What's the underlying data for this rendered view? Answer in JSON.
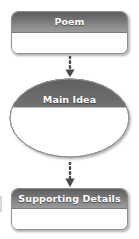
{
  "diagram": {
    "type": "vertical-flowchart",
    "background_color": "#ffffff",
    "header_gradient_from": "#5f5f5f",
    "header_gradient_to": "#9b9b9b",
    "header_text_color": "#ffffff",
    "border_color": "#8e8e8e",
    "connector_color": "#4a4a4a",
    "nodes": [
      {
        "id": "poem",
        "label": "Poem",
        "shape": "rounded-rectangle"
      },
      {
        "id": "main-idea",
        "label": "Main Idea",
        "shape": "ellipse"
      },
      {
        "id": "supporting-details",
        "label": "Supporting Details",
        "shape": "rounded-rectangle"
      }
    ],
    "connectors": [
      {
        "id": "connector-1",
        "from": "poem",
        "to": "main-idea",
        "style": "dotted",
        "direction": "down",
        "arrowhead": "solid-triangle"
      },
      {
        "id": "connector-2",
        "from": "main-idea",
        "to": "supporting-details",
        "style": "dotted",
        "direction": "down",
        "arrowhead": "solid-triangle"
      }
    ]
  }
}
